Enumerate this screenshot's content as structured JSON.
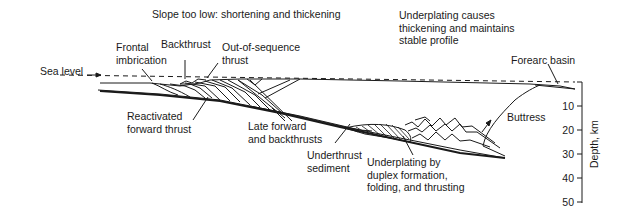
{
  "figure": {
    "type": "accretionary wedge cross-section",
    "annotations": {
      "slope_note": "Slope too low: shortening and thickening",
      "underplating_note": "Underplating causes\nthickening and maintains\nstable profile",
      "frontal_imbrication": "Frontal\nimbrication",
      "backthrust": "Backthrust",
      "out_of_sequence": "Out-of-sequence\nthrust",
      "sea_level": "Sea level",
      "forearc_basin": "Forearc basin",
      "reactivated": "Reactivated\nforward thrust",
      "late_forward": "Late forward\nand backthrusts",
      "underthrust": "Underthrust\nsediment",
      "underplating_by": "Underplating by\nduplex formation,\nfolding, and thrusting",
      "buttress": "Buttress"
    },
    "depth_axis": {
      "title": "Depth, km",
      "ticks": [
        "10",
        "20",
        "30",
        "40",
        "50"
      ]
    },
    "colors": {
      "line": "#1a1a1a",
      "background": "#ffffff"
    }
  }
}
